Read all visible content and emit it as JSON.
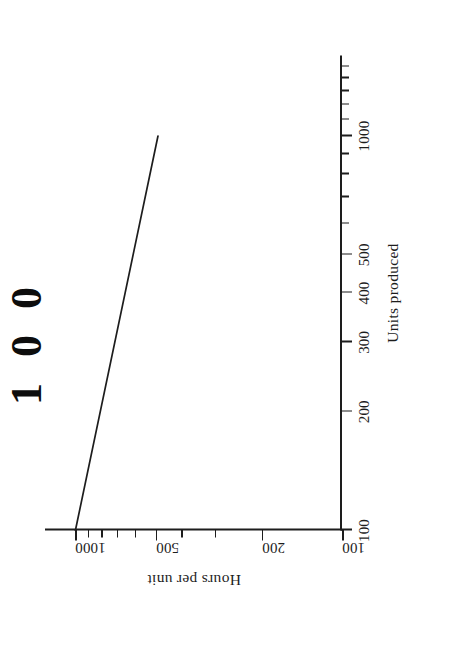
{
  "page": {
    "background_color": "#ffffff",
    "ink_color": "#1d1d1d",
    "orientation_note": "figure printed sideways; rotated 90 degrees counter-clockwise on the scanned page"
  },
  "title_fragment": {
    "text": "100",
    "note": "large bold characters cropped at the left edge of the scan"
  },
  "chart_data": {
    "type": "line",
    "title": "",
    "subtitle": "",
    "xlabel": "Units produced",
    "ylabel": "Hours per unit",
    "xscale": "log",
    "yscale": "log",
    "xlim": [
      100,
      1600
    ],
    "ylim": [
      100,
      1300
    ],
    "grid": false,
    "legend": null,
    "x_ticks": [
      100,
      200,
      300,
      400,
      500,
      600,
      700,
      800,
      900,
      1000,
      1100,
      1200,
      1300,
      1400,
      1500
    ],
    "x_tick_labels": [
      "100",
      "200",
      "300",
      "400",
      "500",
      "",
      "",
      "",
      "",
      "1000",
      "",
      "",
      "",
      "",
      ""
    ],
    "y_ticks": [
      100,
      200,
      300,
      400,
      500,
      600,
      700,
      800,
      900,
      1000
    ],
    "y_tick_labels": [
      "100",
      "200",
      "",
      "",
      "500",
      "",
      "",
      "",
      "",
      "1000"
    ],
    "series": [
      {
        "name": "Learning curve",
        "x": [
          100,
          1000
        ],
        "y": [
          1000,
          490
        ]
      }
    ],
    "annotations": []
  }
}
